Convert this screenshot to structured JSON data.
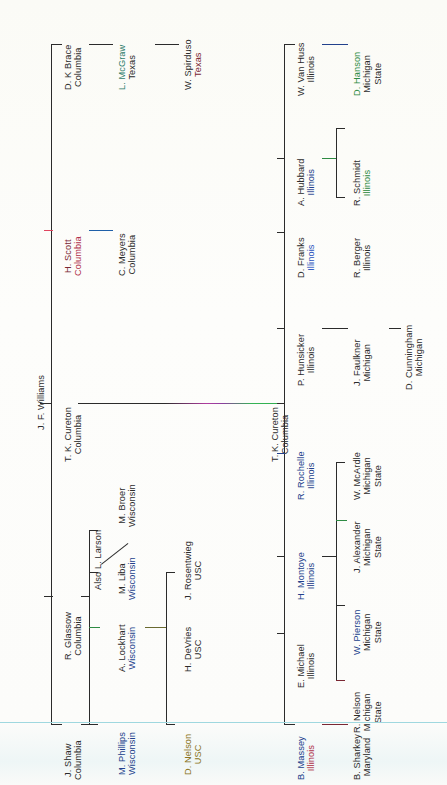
{
  "diagram": {
    "type": "academic-lineage-tree",
    "orientation": "rotated-90-counterclockwise",
    "root": "J. F. Williams"
  },
  "nodes": {
    "williams": {
      "name": "J. F. Williams",
      "school": ""
    },
    "brace": {
      "name": "D. K Brace",
      "school": "Columbia"
    },
    "mcgraw": {
      "name": "L. McGraw",
      "school": "Texas"
    },
    "spirduso": {
      "name": "W. Spirduso",
      "school": "Texas"
    },
    "scott": {
      "name": "H. Scott",
      "school": "Columbia"
    },
    "meyers": {
      "name": "C. Meyers",
      "school": "Columbia"
    },
    "cureton_left": {
      "name": "T. K. Cureton",
      "school": "Columbia"
    },
    "cureton_right": {
      "name": "T. K. Cureton",
      "school": "Columbia"
    },
    "glassow": {
      "name": "R. Glassow",
      "school": "Columbia"
    },
    "larson": {
      "name": "Also L. Larson",
      "school": ""
    },
    "broer": {
      "name": "M. Broer",
      "school": "Wisconsin"
    },
    "liba": {
      "name": "M. Liba",
      "school": "Wisconsin"
    },
    "lockhart": {
      "name": "A. Lockhart",
      "school": "Wisconsin"
    },
    "phillips": {
      "name": "M. Phillips",
      "school": "Wisconsin"
    },
    "rosentwieg": {
      "name": "J. Rosentwieg",
      "school": "USC"
    },
    "devries": {
      "name": "H. DeVries",
      "school": "USC"
    },
    "dnelson": {
      "name": "D. Nelson",
      "school": "USC"
    },
    "shaw": {
      "name": "J. Shaw",
      "school": "Columbia"
    },
    "vanhuss": {
      "name": "W. Van Huss",
      "school": "Illinois"
    },
    "hanson": {
      "name": "D. Hanson",
      "school": "Michigan State"
    },
    "hubbard": {
      "name": "A. Hubbard",
      "school": "Illinois"
    },
    "schmidt": {
      "name": "R. Schmidt",
      "school": "Illinois"
    },
    "berger": {
      "name": "R. Berger",
      "school": "Illinois"
    },
    "franks": {
      "name": "D. Franks",
      "school": "Illinois"
    },
    "hunsicker": {
      "name": "P. Hunsicker",
      "school": "Illinois"
    },
    "faulkner": {
      "name": "J. Faulkner",
      "school": "Michigan"
    },
    "cunningham": {
      "name": "D. Cunningham",
      "school": "Michigan"
    },
    "rochelle": {
      "name": "R. Rochelle",
      "school": "Illinois"
    },
    "mcardle": {
      "name": "W. McArdle",
      "school": "Michigan State"
    },
    "alexander": {
      "name": "J. Alexander",
      "school": "Michigan State"
    },
    "montoye": {
      "name": "H. Montoye",
      "school": "Illinois"
    },
    "pierson": {
      "name": "W. Pierson",
      "school": "Michigan State"
    },
    "rnelson": {
      "name": "R. Nelson",
      "school": "Michigan State"
    },
    "emichael": {
      "name": "E. Michael",
      "school": "Illinois"
    },
    "massey": {
      "name": "B. Massey",
      "school": "Illinois"
    },
    "sharkey": {
      "name": "B. Sharkey",
      "school": "Maryland"
    }
  },
  "colors": {
    "text_default": "#2b2b2b",
    "navy": "#22418c",
    "green": "#2e8b43",
    "red": "#b0304a",
    "maroon": "#7a2733",
    "olive": "#8a7320",
    "connector_default": "#2b2b2b"
  }
}
